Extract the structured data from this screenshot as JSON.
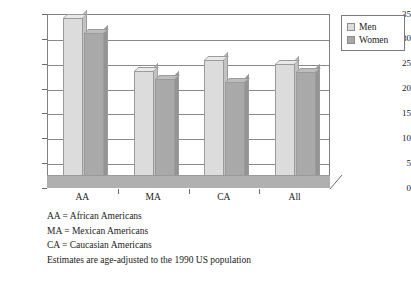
{
  "chart_data": {
    "type": "bar",
    "title": "",
    "xlabel": "",
    "ylabel": "Prevalence (%)",
    "ylim": [
      0,
      35
    ],
    "yticks": [
      0,
      5,
      10,
      15,
      20,
      25,
      30,
      35
    ],
    "ytick_labels": [
      "0",
      "5",
      "10",
      "15",
      "20",
      "25",
      "30",
      "35"
    ],
    "grid": true,
    "legend_position": "top-right",
    "categories": [
      "AA",
      "MA",
      "CA",
      "All"
    ],
    "series": [
      {
        "name": "Men",
        "values": [
          34.0,
          23.3,
          25.6,
          24.8
        ],
        "color": "#dcdcdc"
      },
      {
        "name": "Women",
        "values": [
          31.0,
          21.8,
          21.2,
          23.2
        ],
        "color": "#a9a9a9"
      }
    ],
    "annotations": [
      "AA = African Americans",
      "MA = Mexican Americans",
      "CA = Caucasian Americans",
      "Estimates are age-adjusted to the 1990 US population"
    ]
  },
  "legend": {
    "items": [
      {
        "label": "Men",
        "swatch": "men"
      },
      {
        "label": "Women",
        "swatch": "women"
      }
    ]
  },
  "caption": {
    "lines": [
      "AA = African Americans",
      "MA = Mexican Americans",
      "CA = Caucasian Americans",
      "Estimates are age-adjusted to the 1990 US population"
    ]
  },
  "colors": {
    "men": "#dcdcdc",
    "women": "#a9a9a9",
    "floor": "#b0b0b0",
    "frame": "#808080",
    "text": "#1a1a1a"
  }
}
